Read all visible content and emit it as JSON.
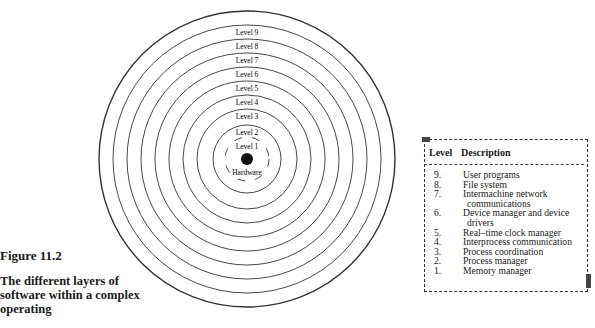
{
  "figure": {
    "number_label": "Figure 11.2",
    "description": "The different layers of software within a complex operating"
  },
  "diagram": {
    "center_label": "Hardware",
    "rings": [
      {
        "label": "Level 1",
        "radius": 22,
        "dashed": true
      },
      {
        "label": "Level 2",
        "radius": 34
      },
      {
        "label": "Level 3",
        "radius": 50
      },
      {
        "label": "Level 4",
        "radius": 64
      },
      {
        "label": "Level 5",
        "radius": 78
      },
      {
        "label": "Level 6",
        "radius": 92
      },
      {
        "label": "Level 7",
        "radius": 106
      },
      {
        "label": "Level 8",
        "radius": 120
      },
      {
        "label": "Level 9",
        "radius": 134
      },
      {
        "label": "",
        "radius": 148
      }
    ]
  },
  "table": {
    "headers": [
      "Level",
      "Description"
    ],
    "rows": [
      {
        "level": "9.",
        "description": "User programs"
      },
      {
        "level": "8.",
        "description": "File system"
      },
      {
        "level": "7.",
        "description": "Intermachine network",
        "continuation": "communications"
      },
      {
        "level": "6.",
        "description": "Device manager and device",
        "continuation": "drivers"
      },
      {
        "level": "5.",
        "description": "Real–time clock manager"
      },
      {
        "level": "4.",
        "description": "Interprocess communication"
      },
      {
        "level": "3.",
        "description": "Process coordination"
      },
      {
        "level": "2.",
        "description": "Process manager"
      },
      {
        "level": "1.",
        "description": "Memory manager"
      }
    ]
  }
}
